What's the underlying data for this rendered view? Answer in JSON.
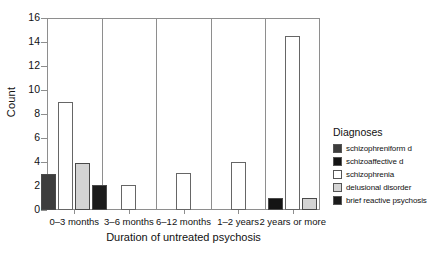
{
  "chart_data": {
    "type": "bar",
    "title": "",
    "xlabel": "Duration of untreated psychosis",
    "ylabel": "Count",
    "categories": [
      "0–3 months",
      "3–6 months",
      "6–12 months",
      "1–2 years",
      "2 years or more"
    ],
    "ylim": [
      0,
      16
    ],
    "yticks": [
      0,
      2,
      4,
      6,
      8,
      10,
      12,
      14,
      16
    ],
    "grid": false,
    "legend_position": "right",
    "legend_title": "Diagnoses",
    "series": [
      {
        "name": "schizophreniform d",
        "color": "#3d3d3d",
        "values": [
          3.0,
          0,
          0,
          0,
          0
        ]
      },
      {
        "name": "schizoaffective d",
        "color": "#141414",
        "values": [
          0,
          0,
          0,
          0,
          1.0
        ]
      },
      {
        "name": "schizophrenia",
        "color": "#ffffff",
        "values": [
          9.0,
          2.1,
          3.1,
          4.0,
          14.5
        ]
      },
      {
        "name": "delusional disorder",
        "color": "#d4d4d4",
        "values": [
          3.9,
          0,
          0,
          0,
          1.0
        ]
      },
      {
        "name": "brief reactive psychosis",
        "color": "#1c1c1c",
        "values": [
          2.1,
          0,
          0,
          0,
          0
        ]
      }
    ]
  },
  "legend": {
    "title": "Diagnoses",
    "items": [
      {
        "label": "schizophreniform d",
        "color": "#3d3d3d"
      },
      {
        "label": "schizoaffective d",
        "color": "#141414"
      },
      {
        "label": "schizophrenia",
        "color": "#ffffff"
      },
      {
        "label": "delusional disorder",
        "color": "#d4d4d4"
      },
      {
        "label": "brief reactive psychosis",
        "color": "#1c1c1c"
      }
    ]
  },
  "axes": {
    "y_title": "Count",
    "x_title": "Duration of untreated psychosis",
    "y_tick_labels": [
      "0",
      "2",
      "4",
      "6",
      "8",
      "10",
      "12",
      "14",
      "16"
    ],
    "x_tick_labels": [
      "0–3 months",
      "3–6 months",
      "6–12 months",
      "1–2 years",
      "2 years or more"
    ]
  }
}
